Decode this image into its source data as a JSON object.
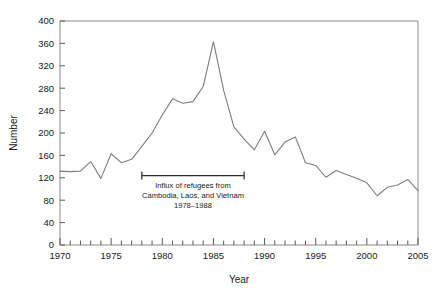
{
  "chart_data": {
    "type": "line",
    "title": "",
    "xlabel": "Year",
    "ylabel": "Number",
    "xlim": [
      1970,
      2005
    ],
    "ylim": [
      0,
      400
    ],
    "ytick_step": 40,
    "xtick_step": 5,
    "xminor_step": 1,
    "grid": false,
    "legend": null,
    "line_color": "#7d7d7d",
    "x": [
      1970,
      1971,
      1972,
      1973,
      1974,
      1975,
      1976,
      1977,
      1978,
      1979,
      1980,
      1981,
      1982,
      1983,
      1984,
      1985,
      1986,
      1987,
      1988,
      1989,
      1990,
      1991,
      1992,
      1993,
      1994,
      1995,
      1996,
      1997,
      1998,
      1999,
      2000,
      2001,
      2002,
      2003,
      2004,
      2005
    ],
    "values": [
      132,
      131,
      132,
      149,
      119,
      163,
      147,
      153,
      176,
      200,
      232,
      261,
      253,
      256,
      283,
      363,
      276,
      211,
      189,
      170,
      203,
      161,
      184,
      193,
      147,
      142,
      121,
      133,
      126,
      119,
      111,
      88,
      103,
      107,
      117,
      97
    ],
    "y_tick_labels": [
      "0",
      "40",
      "80",
      "120",
      "160",
      "200",
      "240",
      "280",
      "320",
      "360",
      "400"
    ],
    "x_tick_labels": [
      "1970",
      "1975",
      "1980",
      "1985",
      "1990",
      "1995",
      "2000",
      "2005"
    ],
    "annotations": [
      {
        "type": "range-bar",
        "x_start": 1978,
        "x_end": 1988,
        "y": 124,
        "lines": [
          "Influx of refugees from",
          "Cambodia, Laos, and Vietnam",
          "1978–1988"
        ]
      }
    ]
  },
  "axes": {
    "y_title": "Number",
    "x_title": "Year"
  }
}
